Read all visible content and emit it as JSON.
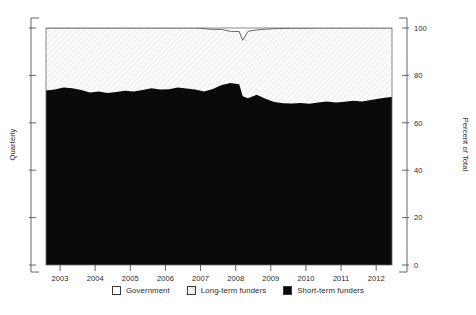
{
  "chart_data": {
    "type": "area",
    "title": "",
    "subtitle": "",
    "stacked": true,
    "stack_total": 100,
    "xlabel": "",
    "ylabel": "Quarterly",
    "ylabel_right": "Percent of Total",
    "xlim": [
      2002.6,
      2012.45
    ],
    "ylim": [
      0,
      100
    ],
    "grid": false,
    "legend_position": "bottom",
    "xtick_labels": [
      "2003",
      "2004",
      "2005",
      "2006",
      "2007",
      "2008",
      "2009",
      "2010",
      "2011",
      "2012"
    ],
    "xticks": [
      2003,
      2004,
      2005,
      2006,
      2007,
      2008,
      2009,
      2010,
      2011,
      2012
    ],
    "ytick_labels_right": [
      "0",
      "20",
      "40",
      "60",
      "80",
      "100"
    ],
    "yticks_right": [
      0,
      20,
      40,
      60,
      80,
      100
    ],
    "ytick_labels_left": [
      "",
      "",
      "",
      "",
      "",
      ""
    ],
    "yticks_left": [
      0,
      20,
      40,
      60,
      80,
      100
    ],
    "x": [
      2002.6,
      2002.85,
      2003.1,
      2003.35,
      2003.6,
      2003.85,
      2004.1,
      2004.35,
      2004.6,
      2004.85,
      2005.1,
      2005.35,
      2005.6,
      2005.85,
      2006.1,
      2006.35,
      2006.6,
      2006.85,
      2007.1,
      2007.35,
      2007.6,
      2007.85,
      2008.1,
      2008.2,
      2008.35,
      2008.6,
      2008.85,
      2009.1,
      2009.35,
      2009.6,
      2009.85,
      2010.1,
      2010.35,
      2010.6,
      2010.85,
      2011.1,
      2011.35,
      2011.6,
      2011.85,
      2012.1,
      2012.35,
      2012.45
    ],
    "series": [
      {
        "name": "Short-term funders",
        "color": "#0a0a0a",
        "fill": "solid-black",
        "values": [
          73.6,
          74.1,
          74.9,
          74.6,
          73.8,
          72.8,
          73.2,
          72.6,
          73.0,
          73.5,
          73.2,
          73.8,
          74.6,
          74.0,
          74.2,
          74.9,
          74.5,
          74.0,
          73.2,
          74.3,
          76.0,
          76.8,
          76.3,
          71.2,
          70.4,
          71.8,
          70.2,
          68.8,
          68.3,
          68.1,
          68.4,
          68.0,
          68.6,
          69.0,
          68.6,
          68.9,
          69.3,
          69.0,
          69.6,
          70.3,
          70.8,
          70.9
        ]
      },
      {
        "name": "Long-term funders",
        "color": "#fbfbfb",
        "fill": "diagonal-hatch",
        "values": [
          26.4,
          25.9,
          25.1,
          25.4,
          26.2,
          27.2,
          26.8,
          27.4,
          27.0,
          26.5,
          26.8,
          26.2,
          25.4,
          26.0,
          25.8,
          25.1,
          25.5,
          26.0,
          26.5,
          25.1,
          23.4,
          21.8,
          22.2,
          23.6,
          28.2,
          27.4,
          29.3,
          30.9,
          31.5,
          31.8,
          31.5,
          31.9,
          31.4,
          31.0,
          31.4,
          31.1,
          30.7,
          31.0,
          30.4,
          29.7,
          29.2,
          29.1
        ]
      },
      {
        "name": "Government",
        "color": "#ffffff",
        "fill": "white",
        "values": [
          0.0,
          0.0,
          0.0,
          0.0,
          0.0,
          0.0,
          0.0,
          0.0,
          0.0,
          0.0,
          0.0,
          0.0,
          0.0,
          0.0,
          0.0,
          0.0,
          0.0,
          0.0,
          0.3,
          0.6,
          0.6,
          1.4,
          1.5,
          5.2,
          1.4,
          0.8,
          0.5,
          0.3,
          0.2,
          0.1,
          0.1,
          0.1,
          0.0,
          0.0,
          0.0,
          0.0,
          0.0,
          0.0,
          0.0,
          0.0,
          0.0,
          0.0
        ]
      }
    ]
  },
  "legend": {
    "items": [
      {
        "label": "Government",
        "swatch": "government"
      },
      {
        "label": "Long-term funders",
        "swatch": "longterm"
      },
      {
        "label": "Short-term funders",
        "swatch": "shortterm"
      }
    ]
  },
  "axes": {
    "left_title": "Quarterly",
    "right_title": "Percent of Total"
  }
}
